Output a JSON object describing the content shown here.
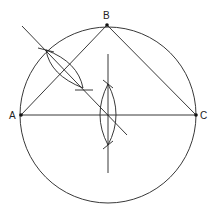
{
  "diagram": {
    "colors": {
      "line": "#222222",
      "background": "#ffffff"
    },
    "points": [
      {
        "id": "A",
        "label": "A",
        "x": 21,
        "y": 115
      },
      {
        "id": "B",
        "label": "B",
        "x": 107,
        "y": 25
      },
      {
        "id": "C",
        "label": "C",
        "x": 196,
        "y": 115
      }
    ],
    "circle": {
      "cx": 108,
      "cy": 115,
      "r": 88
    },
    "labels": {
      "A": "A",
      "B": "B",
      "C": "C"
    }
  }
}
